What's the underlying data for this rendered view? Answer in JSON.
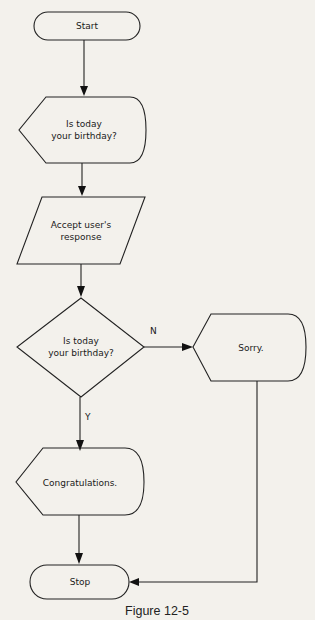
{
  "diagram": {
    "type": "flowchart",
    "background": "#f3f1ec",
    "stroke_color": "#222222",
    "nodes": {
      "start": {
        "shape": "terminal",
        "label": "Start"
      },
      "display_question": {
        "shape": "display",
        "line1": "Is today",
        "line2": "your birthday?"
      },
      "input_response": {
        "shape": "parallelogram",
        "line1": "Accept user's",
        "line2": "response"
      },
      "decision": {
        "shape": "diamond",
        "line1": "Is today",
        "line2": "your birthday?"
      },
      "congrats": {
        "shape": "display",
        "label": "Congratulations."
      },
      "sorry": {
        "shape": "display",
        "label": "Sorry."
      },
      "stop": {
        "shape": "terminal",
        "label": "Stop"
      }
    },
    "edges": {
      "no_label": "N",
      "yes_label": "Y"
    },
    "caption": "Figure 12-5"
  }
}
